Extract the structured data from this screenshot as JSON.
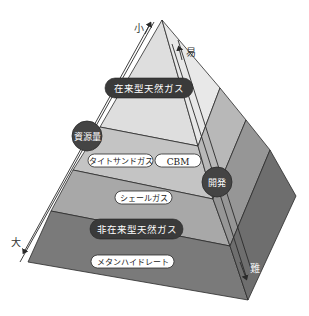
{
  "diagram": {
    "type": "resource-pyramid",
    "axes": {
      "resource_volume": {
        "label": "資源量",
        "top_label": "小",
        "bottom_label": "大"
      },
      "development": {
        "label": "開発",
        "top_label": "易",
        "bottom_label": "難"
      }
    },
    "layers": [
      {
        "id": "conventional",
        "label": "在来型天然ガス",
        "style": "dark-pill"
      },
      {
        "id": "tight-sand",
        "label": "タイトサンドガス",
        "style": "light-pill"
      },
      {
        "id": "cbm",
        "label": "CBM",
        "style": "light-pill"
      },
      {
        "id": "shale",
        "label": "シェールガス",
        "style": "light-pill"
      },
      {
        "id": "unconventional",
        "label": "非在来型天然ガス",
        "style": "dark-pill"
      },
      {
        "id": "methane-hydrate",
        "label": "メタンハイドレート",
        "style": "light-pill"
      }
    ],
    "colors": {
      "layer1_front": "#dedede",
      "layer2_front": "#c4c4c4",
      "layer3_front": "#a8a8a8",
      "layer4_front": "#7a7a7a",
      "layer1_side": "#e8e8e8",
      "layer2_side": "#b8b8b8",
      "layer3_side": "#969696",
      "layer4_side": "#6e6e6e",
      "pill_dark": "#3a3a3a",
      "pill_light": "#ffffff",
      "circle_dark": "#444444",
      "outline": "#2a2a2a"
    }
  }
}
